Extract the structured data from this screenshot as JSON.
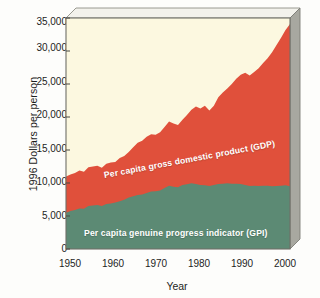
{
  "chart_data": {
    "type": "area",
    "stacked": true,
    "title": "",
    "subtitle": "",
    "xlabel": "Year",
    "ylabel": "1996 Dollars per person",
    "xlim": [
      1950,
      2000
    ],
    "ylim": [
      0,
      35000
    ],
    "xticks": [
      "1950",
      "1960",
      "1970",
      "1980",
      "1990",
      "2000"
    ],
    "yticks": [
      "0",
      "5,000",
      "10,000",
      "15,000",
      "20,000",
      "25,000",
      "30,000",
      "35,000"
    ],
    "grid": false,
    "legend_position": "inline-annotations",
    "annotations": [
      {
        "name": "gdp-annotation",
        "text": "Per capita gross domestic product (GDP)"
      },
      {
        "name": "gpi-annotation",
        "text": "Per capita genuine progress indicator (GPI)"
      }
    ],
    "colors": {
      "gdp_band": "#e0503b",
      "gpi_band": "#5c8a74",
      "background": "#fcf8e0",
      "frame": "#8e8e86",
      "axis_text": "#1d1d1d",
      "label_text": "#ffffff"
    },
    "x": [
      1950,
      1951,
      1952,
      1953,
      1954,
      1955,
      1956,
      1957,
      1958,
      1959,
      1960,
      1961,
      1962,
      1963,
      1964,
      1965,
      1966,
      1967,
      1968,
      1969,
      1970,
      1971,
      1972,
      1973,
      1974,
      1975,
      1976,
      1977,
      1978,
      1979,
      1980,
      1981,
      1982,
      1983,
      1984,
      1985,
      1986,
      1987,
      1988,
      1989,
      1990,
      1991,
      1992,
      1993,
      1994,
      1995,
      1996,
      1997,
      1998,
      1999,
      2000
    ],
    "series": [
      {
        "name": "Per capita genuine progress indicator (GPI)",
        "key": "gpi",
        "color": "#5c8a74",
        "values": [
          5500,
          5750,
          5900,
          6150,
          6100,
          6500,
          6600,
          6650,
          6500,
          6800,
          6900,
          7050,
          7250,
          7450,
          7800,
          8000,
          8200,
          8250,
          8500,
          8700,
          8750,
          8850,
          9250,
          9600,
          9450,
          9350,
          9700,
          9800,
          9950,
          9850,
          9700,
          9650,
          9550,
          9700,
          9850,
          9900,
          9950,
          9900,
          9900,
          9850,
          9700,
          9550,
          9600,
          9550,
          9600,
          9600,
          9500,
          9550,
          9600,
          9650,
          9500
        ]
      },
      {
        "name": "Per capita gross domestic product (GDP)",
        "key": "gdp",
        "color": "#e0503b",
        "values": [
          11000,
          11300,
          11500,
          11900,
          11700,
          12400,
          12500,
          12600,
          12300,
          12900,
          13100,
          13200,
          13800,
          14100,
          14700,
          15400,
          16100,
          16400,
          17000,
          17400,
          17300,
          17700,
          18500,
          19300,
          19000,
          18800,
          19600,
          20300,
          21100,
          21600,
          21300,
          21700,
          21000,
          21700,
          23000,
          23700,
          24300,
          25000,
          25800,
          26400,
          26700,
          26300,
          26800,
          27400,
          28200,
          28900,
          29800,
          30900,
          32000,
          33200,
          34100
        ]
      }
    ]
  }
}
